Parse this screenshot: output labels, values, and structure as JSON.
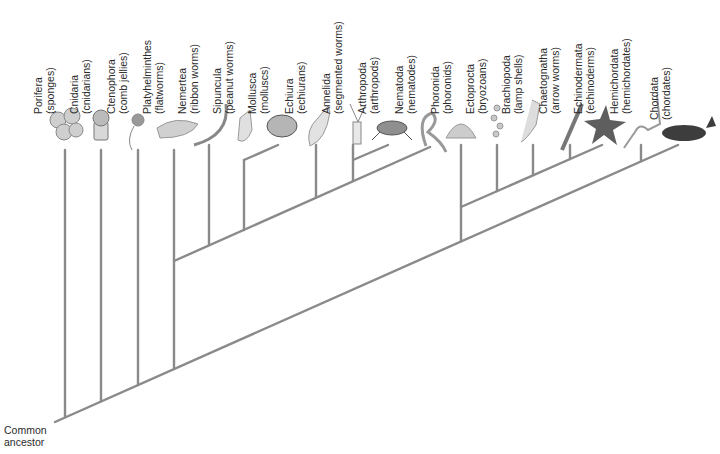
{
  "diagram": {
    "type": "phylogenetic-tree",
    "root_label": {
      "line1": "Common",
      "line2": "ancestor"
    },
    "colors": {
      "branch": "#8a8a8a",
      "text": "#2b2b2b",
      "background": "#ffffff"
    },
    "taxa": [
      {
        "id": "porifera",
        "name": "Porifera",
        "common": "(sponges)",
        "x": 65
      },
      {
        "id": "cnidaria",
        "name": "Cnidaria",
        "common": "(cnidarians)",
        "x": 101
      },
      {
        "id": "ctenophora",
        "name": "Ctenophora",
        "common": "(comb jellies)",
        "x": 138
      },
      {
        "id": "platyhelminthes",
        "name": "Platyhelminthes",
        "common": "(flatworms)",
        "x": 174
      },
      {
        "id": "nemertea",
        "name": "Nemertea",
        "common": "(ribbon worms)",
        "x": 209
      },
      {
        "id": "sipuncula",
        "name": "Sipuncula",
        "common": "(peanut worms)",
        "x": 244
      },
      {
        "id": "mollusca",
        "name": "Mollusca",
        "common": "(molluscs)",
        "x": 278
      },
      {
        "id": "echiura",
        "name": "Echiura",
        "common": "(echiurans)",
        "x": 316
      },
      {
        "id": "annelida",
        "name": "Annelida",
        "common": "(segmented worms)",
        "x": 353
      },
      {
        "id": "arthropoda",
        "name": "Arthropoda",
        "common": "(arthropods)",
        "x": 388
      },
      {
        "id": "nematoda",
        "name": "Nematoda",
        "common": "(nematodes)",
        "x": 426
      },
      {
        "id": "phoronida",
        "name": "Phoronida",
        "common": "(phoronids)",
        "x": 461
      },
      {
        "id": "ectoprocta",
        "name": "Ectoprocta",
        "common": "(bryozoans)",
        "x": 497
      },
      {
        "id": "brachiopoda",
        "name": "Brachiopoda",
        "common": "(lamp shells)",
        "x": 533
      },
      {
        "id": "chaetognatha",
        "name": "Chaetognatha",
        "common": "(arrow worms)",
        "x": 570
      },
      {
        "id": "echinodermata",
        "name": "Echinodermata",
        "common": "(echinoderms)",
        "x": 605
      },
      {
        "id": "hemichordata",
        "name": "Hemichordata",
        "common": "(hemichordates)",
        "x": 641
      },
      {
        "id": "chordata",
        "name": "Chordata",
        "common": "(chordates)",
        "x": 680
      }
    ]
  }
}
